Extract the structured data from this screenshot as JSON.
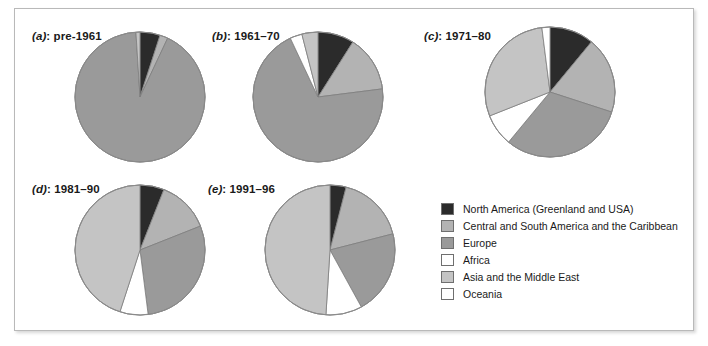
{
  "figure": {
    "background": "#ffffff",
    "frame_color": "#b9b9b9"
  },
  "legend": {
    "title": "",
    "items": [
      {
        "label": "North America (Greenland and USA)",
        "color": "#2b2b2b",
        "key": "north_america"
      },
      {
        "label": "Central and South America and the Caribbean",
        "color": "#b3b3b3",
        "key": "central_south_america"
      },
      {
        "label": "Europe",
        "color": "#9a9a9a",
        "key": "europe"
      },
      {
        "label": "Africa",
        "color": "#ffffff",
        "key": "africa"
      },
      {
        "label": "Asia and the Middle East",
        "color": "#c4c4c4",
        "key": "asia_middle_east"
      },
      {
        "label": "Oceania",
        "color": "#ffffff",
        "key": "oceania"
      }
    ]
  },
  "chart_data": {
    "type": "pie",
    "title": "",
    "legend_position": "right-bottom",
    "series_labels": [
      "North America (Greenland and USA)",
      "Central and South America and the Caribbean",
      "Europe",
      "Africa",
      "Asia and the Middle East",
      "Oceania"
    ],
    "colors": [
      "#2b2b2b",
      "#b3b3b3",
      "#9a9a9a",
      "#ffffff",
      "#c4c4c4",
      "#ffffff"
    ],
    "units": "percent",
    "charts": [
      {
        "id": "a",
        "index_label": "(a)",
        "title": "pre-1961",
        "label": "(a): pre-1961",
        "values": [
          5,
          2,
          92,
          0,
          1,
          0
        ],
        "slices": [
          {
            "label": "North America (Greenland and USA)",
            "value": 5,
            "color": "#2b2b2b"
          },
          {
            "label": "Central and South America and the Caribbean",
            "value": 2,
            "color": "#b3b3b3"
          },
          {
            "label": "Europe",
            "value": 92,
            "color": "#9a9a9a"
          },
          {
            "label": "Africa",
            "value": 0,
            "color": "#ffffff"
          },
          {
            "label": "Asia and the Middle East",
            "value": 1,
            "color": "#c4c4c4"
          },
          {
            "label": "Oceania",
            "value": 0,
            "color": "#ffffff"
          }
        ]
      },
      {
        "id": "b",
        "index_label": "(b)",
        "title": "1961–70",
        "label": "(b): 1961–70",
        "values": [
          9,
          14,
          70,
          3,
          4,
          0
        ],
        "slices": [
          {
            "label": "North America (Greenland and USA)",
            "value": 9,
            "color": "#2b2b2b"
          },
          {
            "label": "Central and South America and the Caribbean",
            "value": 14,
            "color": "#b3b3b3"
          },
          {
            "label": "Europe",
            "value": 70,
            "color": "#9a9a9a"
          },
          {
            "label": "Africa",
            "value": 3,
            "color": "#ffffff"
          },
          {
            "label": "Asia and the Middle East",
            "value": 4,
            "color": "#c4c4c4"
          },
          {
            "label": "Oceania",
            "value": 0,
            "color": "#ffffff"
          }
        ]
      },
      {
        "id": "c",
        "index_label": "(c)",
        "title": "1971–80",
        "label": "(c): 1971–80",
        "values": [
          11,
          19,
          31,
          8,
          29,
          2
        ],
        "slices": [
          {
            "label": "North America (Greenland and USA)",
            "value": 11,
            "color": "#2b2b2b"
          },
          {
            "label": "Central and South America and the Caribbean",
            "value": 19,
            "color": "#b3b3b3"
          },
          {
            "label": "Europe",
            "value": 31,
            "color": "#9a9a9a"
          },
          {
            "label": "Africa",
            "value": 8,
            "color": "#ffffff"
          },
          {
            "label": "Asia and the Middle East",
            "value": 29,
            "color": "#c4c4c4"
          },
          {
            "label": "Oceania",
            "value": 2,
            "color": "#ffffff"
          }
        ]
      },
      {
        "id": "d",
        "index_label": "(d)",
        "title": "1981–90",
        "label": "(d): 1981–90",
        "values": [
          6,
          13,
          29,
          7,
          45,
          0
        ],
        "slices": [
          {
            "label": "North America (Greenland and USA)",
            "value": 6,
            "color": "#2b2b2b"
          },
          {
            "label": "Central and South America and the Caribbean",
            "value": 13,
            "color": "#b3b3b3"
          },
          {
            "label": "Europe",
            "value": 29,
            "color": "#9a9a9a"
          },
          {
            "label": "Africa",
            "value": 7,
            "color": "#ffffff"
          },
          {
            "label": "Asia and the Middle East",
            "value": 45,
            "color": "#c4c4c4"
          },
          {
            "label": "Oceania",
            "value": 0,
            "color": "#ffffff"
          }
        ]
      },
      {
        "id": "e",
        "index_label": "(e)",
        "title": "1991–96",
        "label": "(e): 1991–96",
        "values": [
          4,
          17,
          21,
          9,
          49,
          0
        ],
        "slices": [
          {
            "label": "North America (Greenland and USA)",
            "value": 4,
            "color": "#2b2b2b"
          },
          {
            "label": "Central and South America and the Caribbean",
            "value": 17,
            "color": "#b3b3b3"
          },
          {
            "label": "Europe",
            "value": 21,
            "color": "#9a9a9a"
          },
          {
            "label": "Africa",
            "value": 9,
            "color": "#ffffff"
          },
          {
            "label": "Asia and the Middle East",
            "value": 49,
            "color": "#c4c4c4"
          },
          {
            "label": "Oceania",
            "value": 0,
            "color": "#ffffff"
          }
        ]
      }
    ]
  },
  "layout": {
    "panels": [
      {
        "id": "a",
        "label_x": 32,
        "label_y": 30,
        "pie_cx": 140,
        "pie_cy": 97,
        "pie_r": 65
      },
      {
        "id": "b",
        "label_x": 212,
        "label_y": 30,
        "pie_cx": 318,
        "pie_cy": 97,
        "pie_r": 65
      },
      {
        "id": "c",
        "label_x": 424,
        "label_y": 30,
        "pie_cx": 550,
        "pie_cy": 92,
        "pie_r": 65
      },
      {
        "id": "d",
        "label_x": 32,
        "label_y": 183,
        "pie_cx": 140,
        "pie_cy": 250,
        "pie_r": 65
      },
      {
        "id": "e",
        "label_x": 208,
        "label_y": 183,
        "pie_cx": 330,
        "pie_cy": 250,
        "pie_r": 65
      }
    ],
    "legend_x": 441,
    "legend_y": 200
  }
}
